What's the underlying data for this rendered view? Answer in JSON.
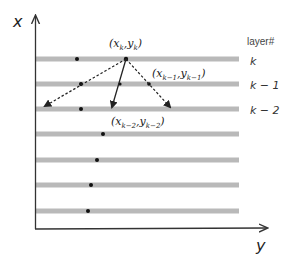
{
  "diagram": {
    "axes": {
      "x_label": "x",
      "y_label": "y"
    },
    "legend": {
      "header": "layer#",
      "labels": [
        "k",
        "k − 1",
        "k − 2"
      ]
    },
    "layers": [
      {
        "y": 59,
        "dot_x": 77
      },
      {
        "y": 84,
        "dot_x": 81
      },
      {
        "y": 109,
        "dot_x": 81
      },
      {
        "y": 134,
        "dot_x": 103
      },
      {
        "y": 160,
        "dot_x": 97
      },
      {
        "y": 185,
        "dot_x": 91
      },
      {
        "y": 211,
        "dot_x": 88
      }
    ],
    "points": {
      "current": {
        "label_main": "(x",
        "sub1": "k",
        "mid": ",y",
        "sub2": "k",
        "end": ")"
      },
      "prev1": {
        "label_main": "(x",
        "sub1": "k−1",
        "mid": ",y",
        "sub2": "k−1",
        "end": ")"
      },
      "prev2": {
        "label_main": "(x",
        "sub1": "k−2",
        "mid": ",y",
        "sub2": "k−2",
        "end": ")"
      }
    },
    "colors": {
      "bar": "#b8b8b8",
      "bar_edge": "#a8a8a8",
      "axis": "#333333",
      "dot": "#111111"
    }
  }
}
